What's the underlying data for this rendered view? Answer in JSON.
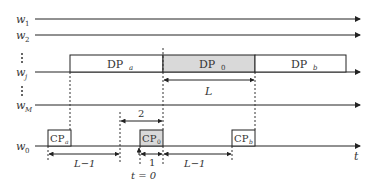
{
  "diagram": {
    "type": "timing-diagram",
    "channels": [
      {
        "id": "w1",
        "label": "w",
        "sub": "1",
        "y": 19
      },
      {
        "id": "w2",
        "label": "w",
        "sub": "2",
        "y": 35
      },
      {
        "id": "wj",
        "label": "w",
        "sub": "j",
        "y": 72
      },
      {
        "id": "wM",
        "label": "w",
        "sub": "M",
        "y": 105
      },
      {
        "id": "w0",
        "label": "w",
        "sub": "0",
        "y": 146
      }
    ],
    "data_packets": [
      {
        "id": "DPa",
        "label": "DP",
        "sub": "a",
        "x1": 70,
        "x2": 163,
        "shaded": false
      },
      {
        "id": "DP0",
        "label": "DP",
        "sub": "0",
        "x1": 163,
        "x2": 255,
        "shaded": true
      },
      {
        "id": "DPb",
        "label": "DP",
        "sub": "b",
        "x1": 255,
        "x2": 346,
        "shaded": false
      }
    ],
    "control_packets": [
      {
        "id": "CPa",
        "label": "CP",
        "sub": "a",
        "x1": 48,
        "x2": 71,
        "shaded": false
      },
      {
        "id": "CP0",
        "label": "CP",
        "sub": "0",
        "x1": 140,
        "x2": 163,
        "shaded": true
      },
      {
        "id": "CPb",
        "label": "CP",
        "sub": "b",
        "x1": 232,
        "x2": 255,
        "shaded": false
      }
    ],
    "dimensions": {
      "dp_length": "L",
      "two_slot": "2",
      "left_gap": "L−1",
      "one_slot": "1",
      "right_gap": "L−1"
    },
    "time_axis_label": "t",
    "origin_label": "t = 0",
    "colors": {
      "line": "#222222",
      "shade": "#d9d9d9",
      "text": "#333333"
    }
  }
}
